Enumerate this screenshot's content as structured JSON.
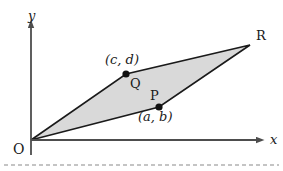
{
  "figure": {
    "type": "geometry-diagram",
    "background_color": "#ffffff",
    "fill_color": "#d9d9d9",
    "stroke_color": "#1a1a1a",
    "axis_color": "#4d4d4d",
    "width": 283,
    "height": 171
  },
  "axes": {
    "x_label": "x",
    "y_label": "y",
    "origin_label": "O",
    "origin_px": {
      "x": 31,
      "y": 140
    },
    "x_axis_end_px": {
      "x": 265,
      "y": 140
    },
    "y_axis_end_px": {
      "x": 31,
      "y": 24
    }
  },
  "points": [
    {
      "name": "Q",
      "label": "Q",
      "coord_label": "(c, d)",
      "px": {
        "x": 126,
        "y": 74
      },
      "label_px": {
        "x": 131,
        "y": 77
      },
      "coord_px": {
        "x": 105,
        "y": 53
      }
    },
    {
      "name": "P",
      "label": "P",
      "coord_label": "(a, b)",
      "px": {
        "x": 159,
        "y": 107
      },
      "label_px": {
        "x": 150,
        "y": 90
      },
      "coord_px": {
        "x": 139,
        "y": 110
      }
    },
    {
      "name": "R",
      "label": "R",
      "coord_label": "",
      "px": {
        "x": 250,
        "y": 45
      },
      "label_px": {
        "x": 257,
        "y": 30
      },
      "coord_px": null
    }
  ],
  "polygon": {
    "name": "parallelogram-OPRQ",
    "vertices": "31,140 159,107 250,45 126,74"
  },
  "footer_rule": {
    "name": "dashed-separator",
    "y_px": 165,
    "style": "dashed"
  }
}
